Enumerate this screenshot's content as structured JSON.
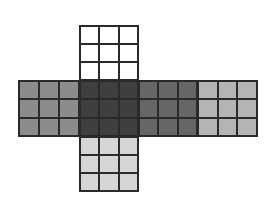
{
  "diagram": {
    "type": "cube-net",
    "faces": [
      {
        "id": "top",
        "color": "#ffffff"
      },
      {
        "id": "left",
        "color": "#8c8c8c"
      },
      {
        "id": "front",
        "color": "#3f3f3f"
      },
      {
        "id": "right",
        "color": "#666666"
      },
      {
        "id": "back",
        "color": "#b4b4b4"
      },
      {
        "id": "bottom",
        "color": "#d6d6d6"
      }
    ],
    "grid": "3x3"
  }
}
